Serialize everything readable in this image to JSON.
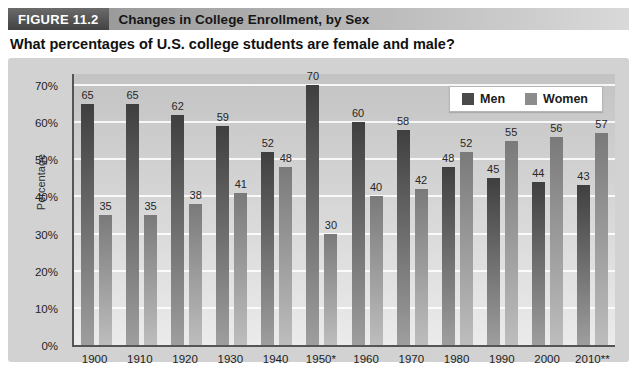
{
  "figure": {
    "label": "FIGURE 11.2",
    "title": "Changes in College Enrollment, by Sex",
    "question": "What percentages of U.S. college students are female and male?"
  },
  "chart_data": {
    "type": "bar",
    "title": "Changes in College Enrollment, by Sex",
    "categories": [
      "1900",
      "1910",
      "1920",
      "1930",
      "1940",
      "1950*",
      "1960",
      "1970",
      "1980",
      "1990",
      "2000",
      "2010**"
    ],
    "series": [
      {
        "name": "Men",
        "values": [
          65,
          65,
          62,
          59,
          52,
          70,
          60,
          58,
          48,
          45,
          44,
          43
        ]
      },
      {
        "name": "Women",
        "values": [
          35,
          35,
          38,
          41,
          48,
          30,
          40,
          42,
          52,
          55,
          56,
          57
        ]
      }
    ],
    "xlabel": "",
    "ylabel": "Percentage",
    "ylim": [
      0,
      70
    ],
    "ytick_step": 10,
    "ytick_suffix": "%",
    "grid": true,
    "legend_position": "top-right",
    "bar_value_labels": true
  },
  "colors": {
    "fig_label_bg_top": "#6b6b6b",
    "fig_label_bg_bottom": "#424242",
    "titlebar_left": "#9b9b9b",
    "titlebar_right": "#d9d9d9",
    "panel_bg": "#d2d2d2",
    "plot_bg_top": "#c3c3c3",
    "plot_bg_bottom": "#ebebeb",
    "axis_color": "#555555",
    "men_bar_top": "#3f3f3f",
    "men_bar_bottom": "#9e9e9e",
    "women_bar_top": "#7a7a7a",
    "women_bar_bottom": "#bdbdbd",
    "men_swatch": "#4a4a4a",
    "women_swatch": "#8c8c8c"
  }
}
